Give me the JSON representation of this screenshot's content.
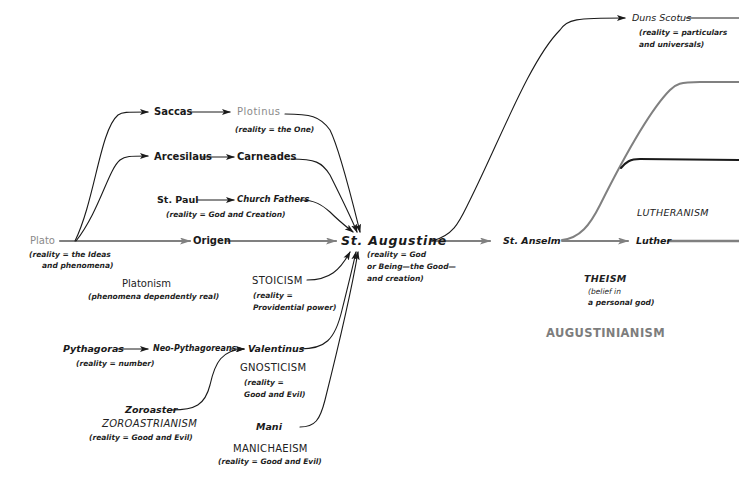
{
  "diagram": {
    "nodes": {
      "plato": {
        "label": "Plato",
        "note_1": "(reality = the Ideas",
        "note_2": "and phenomena)"
      },
      "saccas": {
        "label": "Saccas"
      },
      "plotinus": {
        "label": "Plotinus",
        "note": "(reality = the One)"
      },
      "arcesilaus": {
        "label": "Arcesilaus"
      },
      "carneades": {
        "label": "Carneades"
      },
      "st_paul": {
        "label": "St. Paul"
      },
      "church_fathers": {
        "label": "Church Fathers",
        "note": "(reality = God and Creation)"
      },
      "origen": {
        "label": "Origen"
      },
      "st_augustine": {
        "label": "St. Augustine",
        "note_1": "(reality = God",
        "note_2": "or Being—the Good—",
        "note_3": "and creation)"
      },
      "stoicism": {
        "label": "STOICISM",
        "note_1": "(reality =",
        "note_2": "Providential power)"
      },
      "pythagoras": {
        "label": "Pythagoras",
        "note": "(reality = number)"
      },
      "neo_pythagoreans": {
        "label": "Neo-Pythagoreans"
      },
      "valentinus": {
        "label": "Valentinus"
      },
      "gnosticism": {
        "label": "GNOSTICISM",
        "note_1": "(reality =",
        "note_2": "Good and Evil)"
      },
      "zoroaster": {
        "label": "Zoroaster"
      },
      "zoroastrianism": {
        "label": "ZOROASTRIANISM",
        "note": "(reality = Good and Evil)"
      },
      "mani": {
        "label": "Mani"
      },
      "manichaeism": {
        "label": "MANICHAEISM",
        "note": "(reality = Good and Evil)"
      },
      "st_anselm": {
        "label": "St. Anselm"
      },
      "duns_scotus": {
        "label": "Duns Scotus",
        "note_1": "(reality = particulars",
        "note_2": "and universals)"
      },
      "luther": {
        "label": "Luther"
      }
    },
    "schools": {
      "platonism": {
        "label": "Platonism",
        "note": "(phenomena dependently real)"
      },
      "lutheranism": {
        "label": "LUTHERANISM"
      },
      "theism": {
        "label": "THEISM",
        "note_1": "(belief in",
        "note_2": "a personal god)"
      },
      "augustinianism": {
        "label": "AUGUSTINIANISM"
      }
    },
    "colors": {
      "line_dark": "#1a1a1a",
      "line_gray": "#808080",
      "text_gray": "#8a8a8a"
    }
  }
}
